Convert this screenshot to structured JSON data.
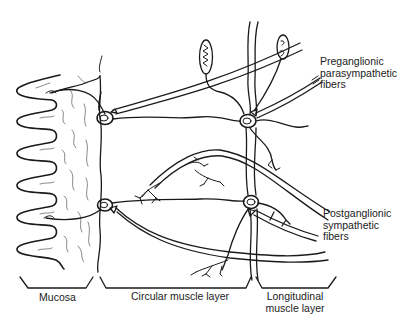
{
  "diagram": {
    "type": "anatomical illustration",
    "labels": {
      "preganglionic": [
        "Preganglionic",
        "parasympathetic",
        "fibers"
      ],
      "postganglionic": [
        "Postganglionic",
        "sympathetic",
        "fibers"
      ],
      "mucosa": "Mucosa",
      "circular": "Circular muscle layer",
      "longitudinal": [
        "Longitudinal",
        "muscle layer"
      ]
    },
    "regions": [
      {
        "name": "Mucosa",
        "bracket_x": [
          20,
          93
        ]
      },
      {
        "name": "Circular muscle layer",
        "bracket_x": [
          100,
          250
        ]
      },
      {
        "name": "Longitudinal muscle layer",
        "bracket_x": [
          256,
          336
        ]
      }
    ],
    "ganglia": [
      {
        "name": "submucosal-ganglion-upper",
        "x": 105,
        "y": 118
      },
      {
        "name": "submucosal-ganglion-lower",
        "x": 105,
        "y": 205
      },
      {
        "name": "myenteric-ganglion-upper",
        "x": 248,
        "y": 121
      },
      {
        "name": "myenteric-ganglion-lower",
        "x": 251,
        "y": 202
      }
    ],
    "colors": {
      "ink": "#1a1a1a",
      "background": "#ffffff"
    }
  }
}
